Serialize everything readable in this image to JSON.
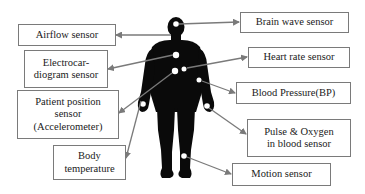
{
  "diagram": {
    "type": "body-sensor-network",
    "figure": "human-silhouette",
    "colors": {
      "figure": "#0a0a0a",
      "sensor_dot": "#ffffff",
      "arrow": "#7a7a7a",
      "box_border": "#7a7a7a",
      "text": "#1a1a1a"
    },
    "left_sensors": [
      {
        "id": "airflow",
        "label": "Airflow sensor"
      },
      {
        "id": "ecg",
        "label": "Electrocar-\ndiogram sensor"
      },
      {
        "id": "position",
        "label": "Patient position\nsensor\n(Accelerometer)"
      },
      {
        "id": "temperature",
        "label": "Body\ntemperature"
      }
    ],
    "right_sensors": [
      {
        "id": "brainwave",
        "label": "Brain wave sensor"
      },
      {
        "id": "heartrate",
        "label": "Heart rate sensor"
      },
      {
        "id": "bp",
        "label": "Blood Pressure(BP)"
      },
      {
        "id": "pulseox",
        "label": "Pulse & Oxygen\nin blood sensor"
      },
      {
        "id": "motion",
        "label": "Motion sensor"
      }
    ]
  }
}
